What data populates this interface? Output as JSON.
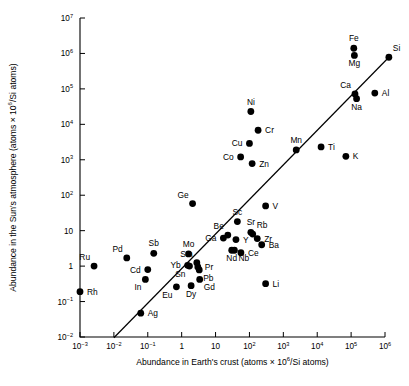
{
  "chart_data": {
    "type": "scatter",
    "title": "",
    "xlabel": "Abundance in Earth's crust (atoms × 10⁶/Si atoms)",
    "ylabel": "Abundance in the Sun's atmosphere (atoms × 10⁶/Si atoms)",
    "xlabel_parts": {
      "pre": "Abundance in Earth's crust (atoms × 10",
      "sup": "6",
      "post": "/Si atoms)"
    },
    "ylabel_parts": {
      "pre": "Abundance in the Sun's atmosphere (atoms × 10",
      "sup": "6",
      "post": "/Si atoms)"
    },
    "xscale": "log",
    "yscale": "log",
    "xlim": [
      0.001,
      1000000
    ],
    "ylim": [
      0.01,
      10000000
    ],
    "grid": false,
    "legend": false,
    "marker": "filled-circle",
    "xticks": [
      {
        "value": 0.001,
        "mantissa": "10",
        "exponent": "−3"
      },
      {
        "value": 0.01,
        "mantissa": "10",
        "exponent": "−2"
      },
      {
        "value": 0.1,
        "mantissa": "10",
        "exponent": "−1"
      },
      {
        "value": 1,
        "mantissa": "1",
        "exponent": ""
      },
      {
        "value": 10,
        "mantissa": "10",
        "exponent": ""
      },
      {
        "value": 100,
        "mantissa": "10",
        "exponent": "2"
      },
      {
        "value": 1000,
        "mantissa": "10",
        "exponent": "3"
      },
      {
        "value": 10000,
        "mantissa": "10",
        "exponent": "4"
      },
      {
        "value": 100000,
        "mantissa": "10",
        "exponent": "5"
      },
      {
        "value": 1000000,
        "mantissa": "10",
        "exponent": "6"
      }
    ],
    "yticks": [
      {
        "value": 10000000,
        "mantissa": "10",
        "exponent": "7"
      },
      {
        "value": 1000000,
        "mantissa": "10",
        "exponent": "6"
      },
      {
        "value": 100000,
        "mantissa": "10",
        "exponent": "5"
      },
      {
        "value": 10000,
        "mantissa": "10",
        "exponent": "4"
      },
      {
        "value": 1000,
        "mantissa": "10",
        "exponent": "3"
      },
      {
        "value": 100,
        "mantissa": "10",
        "exponent": "2"
      },
      {
        "value": 10,
        "mantissa": "10",
        "exponent": ""
      },
      {
        "value": 1,
        "mantissa": "1",
        "exponent": ""
      },
      {
        "value": 0.1,
        "mantissa": "10",
        "exponent": "−1"
      },
      {
        "value": 0.01,
        "mantissa": "10",
        "exponent": "−2"
      }
    ],
    "trendline": {
      "description": "1:1 correlation line",
      "x": [
        0.01,
        1300000
      ],
      "y": [
        0.0095,
        780000
      ]
    },
    "points": [
      {
        "label": "Rh",
        "x": 0.001,
        "y": 0.19,
        "label_pos": "right"
      },
      {
        "label": "Ru",
        "x": 0.0026,
        "y": 1.0,
        "label_pos": "above-left"
      },
      {
        "label": "Ag",
        "x": 0.062,
        "y": 0.047,
        "label_pos": "right"
      },
      {
        "label": "Pd",
        "x": 0.024,
        "y": 1.7,
        "label_pos": "above-left"
      },
      {
        "label": "Cd",
        "x": 0.1,
        "y": 0.8,
        "label_pos": "left"
      },
      {
        "label": "In",
        "x": 0.085,
        "y": 0.42,
        "label_pos": "below-left"
      },
      {
        "label": "Sb",
        "x": 0.15,
        "y": 2.3,
        "label_pos": "above"
      },
      {
        "label": "Eu",
        "x": 0.7,
        "y": 0.26,
        "label_pos": "below-left"
      },
      {
        "label": "Yb",
        "x": 1.5,
        "y": 1.05,
        "label_pos": "left"
      },
      {
        "label": "Sn",
        "x": 1.7,
        "y": 1.0,
        "label_pos": "below-left"
      },
      {
        "label": "Mo",
        "x": 1.6,
        "y": 2.2,
        "label_pos": "above"
      },
      {
        "label": "Ge",
        "x": 2.1,
        "y": 58,
        "label_pos": "above-left"
      },
      {
        "label": "Dy",
        "x": 1.9,
        "y": 0.28,
        "label_pos": "below"
      },
      {
        "label": "Gd",
        "x": 3.4,
        "y": 0.42,
        "label_pos": "below-right"
      },
      {
        "label": "Pr",
        "x": 3.0,
        "y": 0.95,
        "label_pos": "right"
      },
      {
        "label": "Pb",
        "x": 3.3,
        "y": 0.78,
        "label_pos": "below-right"
      },
      {
        "label": "Sm",
        "x": 2.8,
        "y": 1.25,
        "label_pos": "above-left"
      },
      {
        "label": "Ga",
        "x": 17,
        "y": 6.2,
        "label_pos": "left"
      },
      {
        "label": "Be",
        "x": 23,
        "y": 7.5,
        "label_pos": "above-left"
      },
      {
        "label": "Nd",
        "x": 30,
        "y": 2.8,
        "label_pos": "below"
      },
      {
        "label": "Nb",
        "x": 36,
        "y": 2.8,
        "label_pos": "below-right"
      },
      {
        "label": "Y",
        "x": 40,
        "y": 5.6,
        "label_pos": "right"
      },
      {
        "label": "Ce",
        "x": 56,
        "y": 2.4,
        "label_pos": "right"
      },
      {
        "label": "Sc",
        "x": 44,
        "y": 18,
        "label_pos": "above"
      },
      {
        "label": "Sr",
        "x": 110,
        "y": 9.0,
        "label_pos": "above"
      },
      {
        "label": "Rb",
        "x": 125,
        "y": 8.0,
        "label_pos": "above-right"
      },
      {
        "label": "Zr",
        "x": 170,
        "y": 6.0,
        "label_pos": "right"
      },
      {
        "label": "Ba",
        "x": 230,
        "y": 4.0,
        "label_pos": "right"
      },
      {
        "label": "V",
        "x": 300,
        "y": 50,
        "label_pos": "right"
      },
      {
        "label": "Li",
        "x": 300,
        "y": 0.32,
        "label_pos": "right"
      },
      {
        "label": "Cu",
        "x": 100,
        "y": 2900,
        "label_pos": "left"
      },
      {
        "label": "Co",
        "x": 55,
        "y": 1200,
        "label_pos": "left"
      },
      {
        "label": "Zn",
        "x": 120,
        "y": 780,
        "label_pos": "right"
      },
      {
        "label": "Cr",
        "x": 180,
        "y": 6800,
        "label_pos": "right"
      },
      {
        "label": "Ni",
        "x": 110,
        "y": 23000,
        "label_pos": "above"
      },
      {
        "label": "Mn",
        "x": 2400,
        "y": 1900,
        "label_pos": "above"
      },
      {
        "label": "Ti",
        "x": 13000,
        "y": 2300,
        "label_pos": "right"
      },
      {
        "label": "K",
        "x": 70000,
        "y": 1250,
        "label_pos": "right"
      },
      {
        "label": "Ca",
        "x": 130000,
        "y": 72000,
        "label_pos": "above-left"
      },
      {
        "label": "Na",
        "x": 145000,
        "y": 53000,
        "label_pos": "below"
      },
      {
        "label": "Al",
        "x": 500000,
        "y": 76000,
        "label_pos": "right"
      },
      {
        "label": "Fe",
        "x": 120000,
        "y": 1400000,
        "label_pos": "above"
      },
      {
        "label": "Mg",
        "x": 125000,
        "y": 880000,
        "label_pos": "below"
      },
      {
        "label": "Si",
        "x": 1300000,
        "y": 780000,
        "label_pos": "above-right"
      }
    ]
  }
}
